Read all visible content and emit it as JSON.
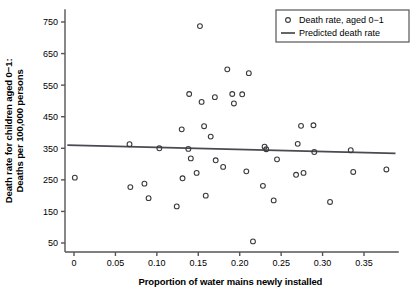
{
  "chart_data": {
    "type": "scatter",
    "title": "",
    "xlabel": "Proportion of water mains newly installed",
    "ylabel": "Death rate for children aged 0−1:\nDeaths per 100,000 persons",
    "ylabel_line1": "Death rate for children aged 0−1:",
    "ylabel_line2": "Deaths per 100,000 persons",
    "xlim": [
      -0.012,
      0.392
    ],
    "ylim": [
      20,
      790
    ],
    "xticks": [
      0,
      0.05,
      0.1,
      0.15,
      0.2,
      0.25,
      0.3,
      0.35
    ],
    "xticklabels": [
      "0",
      "0.05",
      "0.10",
      "0.15",
      "0.20",
      "0.25",
      "0.30",
      "0.35"
    ],
    "yticks": [
      50,
      150,
      250,
      350,
      450,
      550,
      650,
      750
    ],
    "yticklabels": [
      "50",
      "150",
      "250",
      "350",
      "450",
      "550",
      "650",
      "750"
    ],
    "grid": false,
    "legend_position": "top-right",
    "legend": [
      {
        "label": "Death rate, aged 0−1",
        "marker": "open-circle"
      },
      {
        "label": "Predicted death rate",
        "marker": "line"
      }
    ],
    "series": [
      {
        "name": "Death rate, aged 0−1",
        "marker": "open-circle",
        "marker_color": "#3a3a3a",
        "points": [
          {
            "x": 0.001,
            "y": 257
          },
          {
            "x": 0.067,
            "y": 363
          },
          {
            "x": 0.068,
            "y": 227
          },
          {
            "x": 0.085,
            "y": 238
          },
          {
            "x": 0.09,
            "y": 192
          },
          {
            "x": 0.103,
            "y": 350
          },
          {
            "x": 0.124,
            "y": 166
          },
          {
            "x": 0.13,
            "y": 410
          },
          {
            "x": 0.131,
            "y": 255
          },
          {
            "x": 0.138,
            "y": 348
          },
          {
            "x": 0.139,
            "y": 522
          },
          {
            "x": 0.141,
            "y": 318
          },
          {
            "x": 0.148,
            "y": 272
          },
          {
            "x": 0.152,
            "y": 737
          },
          {
            "x": 0.154,
            "y": 497
          },
          {
            "x": 0.157,
            "y": 420
          },
          {
            "x": 0.159,
            "y": 200
          },
          {
            "x": 0.165,
            "y": 387
          },
          {
            "x": 0.17,
            "y": 512
          },
          {
            "x": 0.171,
            "y": 312
          },
          {
            "x": 0.18,
            "y": 291
          },
          {
            "x": 0.185,
            "y": 600
          },
          {
            "x": 0.191,
            "y": 522
          },
          {
            "x": 0.193,
            "y": 492
          },
          {
            "x": 0.203,
            "y": 521
          },
          {
            "x": 0.208,
            "y": 277
          },
          {
            "x": 0.211,
            "y": 588
          },
          {
            "x": 0.216,
            "y": 55
          },
          {
            "x": 0.228,
            "y": 231
          },
          {
            "x": 0.23,
            "y": 355
          },
          {
            "x": 0.232,
            "y": 347
          },
          {
            "x": 0.241,
            "y": 185
          },
          {
            "x": 0.245,
            "y": 315
          },
          {
            "x": 0.268,
            "y": 266
          },
          {
            "x": 0.27,
            "y": 364
          },
          {
            "x": 0.274,
            "y": 421
          },
          {
            "x": 0.277,
            "y": 272
          },
          {
            "x": 0.289,
            "y": 423
          },
          {
            "x": 0.29,
            "y": 338
          },
          {
            "x": 0.309,
            "y": 180
          },
          {
            "x": 0.334,
            "y": 344
          },
          {
            "x": 0.337,
            "y": 275
          },
          {
            "x": 0.377,
            "y": 283
          }
        ]
      }
    ],
    "fit_line": {
      "name": "Predicted death rate",
      "color": "#4a4a52",
      "x0": -0.008,
      "y0": 360,
      "x1": 0.388,
      "y1": 334
    }
  },
  "axis_style": {
    "axis_color": "#555555",
    "marker_color": "#3a3a3a",
    "line_color": "#4a4a52"
  }
}
